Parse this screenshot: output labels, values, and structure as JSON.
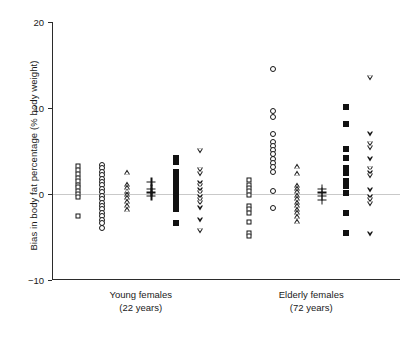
{
  "chart_data": {
    "type": "scatter",
    "title": "",
    "xlabel": "",
    "ylabel": "Bias in body fat percentage (% body weight)",
    "ylim": [
      -10,
      20
    ],
    "yticks": [
      -10,
      0,
      10,
      20
    ],
    "ytick_labels": [
      "−10",
      "0",
      "10",
      "20"
    ],
    "grid": false,
    "legend": null,
    "reference_line": {
      "y": 0,
      "color": "#c9c9c9"
    },
    "groups": [
      {
        "name": "Young females",
        "sublabel": "(22 years)",
        "x_center": 0.255
      },
      {
        "name": "Elderly females",
        "sublabel": "(72 years)",
        "x_center": 0.745
      }
    ],
    "series": [
      {
        "name": "open-square",
        "marker": "open-square",
        "points": [
          {
            "group": 0,
            "x": 0.075,
            "y": 3.2
          },
          {
            "group": 0,
            "x": 0.075,
            "y": 2.8
          },
          {
            "group": 0,
            "x": 0.075,
            "y": 2.3
          },
          {
            "group": 0,
            "x": 0.075,
            "y": 1.9
          },
          {
            "group": 0,
            "x": 0.075,
            "y": 1.5
          },
          {
            "group": 0,
            "x": 0.075,
            "y": 1.1
          },
          {
            "group": 0,
            "x": 0.075,
            "y": 0.8
          },
          {
            "group": 0,
            "x": 0.075,
            "y": 0.4
          },
          {
            "group": 0,
            "x": 0.075,
            "y": 0.0
          },
          {
            "group": 0,
            "x": 0.075,
            "y": -0.4
          },
          {
            "group": 0,
            "x": 0.075,
            "y": -2.6
          },
          {
            "group": 1,
            "x": 0.565,
            "y": 1.6
          },
          {
            "group": 1,
            "x": 0.565,
            "y": 1.1
          },
          {
            "group": 1,
            "x": 0.565,
            "y": 0.7
          },
          {
            "group": 1,
            "x": 0.565,
            "y": 0.3
          },
          {
            "group": 1,
            "x": 0.565,
            "y": -0.1
          },
          {
            "group": 1,
            "x": 0.565,
            "y": -1.4
          },
          {
            "group": 1,
            "x": 0.565,
            "y": -1.8
          },
          {
            "group": 1,
            "x": 0.565,
            "y": -2.2
          },
          {
            "group": 1,
            "x": 0.565,
            "y": -3.2
          },
          {
            "group": 1,
            "x": 0.565,
            "y": -4.5
          },
          {
            "group": 1,
            "x": 0.565,
            "y": -4.9
          }
        ]
      },
      {
        "name": "open-circle",
        "marker": "open-circle",
        "points": [
          {
            "group": 0,
            "x": 0.145,
            "y": 3.4
          },
          {
            "group": 0,
            "x": 0.145,
            "y": 3.0
          },
          {
            "group": 0,
            "x": 0.145,
            "y": 2.6
          },
          {
            "group": 0,
            "x": 0.145,
            "y": 2.2
          },
          {
            "group": 0,
            "x": 0.145,
            "y": 1.8
          },
          {
            "group": 0,
            "x": 0.145,
            "y": 1.4
          },
          {
            "group": 0,
            "x": 0.145,
            "y": 1.0
          },
          {
            "group": 0,
            "x": 0.145,
            "y": 0.6
          },
          {
            "group": 0,
            "x": 0.145,
            "y": 0.2
          },
          {
            "group": 0,
            "x": 0.145,
            "y": -0.2
          },
          {
            "group": 0,
            "x": 0.145,
            "y": -0.6
          },
          {
            "group": 0,
            "x": 0.145,
            "y": -1.0
          },
          {
            "group": 0,
            "x": 0.145,
            "y": -1.4
          },
          {
            "group": 0,
            "x": 0.145,
            "y": -1.8
          },
          {
            "group": 0,
            "x": 0.145,
            "y": -2.2
          },
          {
            "group": 0,
            "x": 0.145,
            "y": -2.6
          },
          {
            "group": 0,
            "x": 0.145,
            "y": -3.0
          },
          {
            "group": 0,
            "x": 0.145,
            "y": -3.4
          },
          {
            "group": 0,
            "x": 0.145,
            "y": -3.9
          },
          {
            "group": 1,
            "x": 0.635,
            "y": 14.5
          },
          {
            "group": 1,
            "x": 0.635,
            "y": 9.6
          },
          {
            "group": 1,
            "x": 0.635,
            "y": 8.9
          },
          {
            "group": 1,
            "x": 0.635,
            "y": 7.0
          },
          {
            "group": 1,
            "x": 0.635,
            "y": 6.1
          },
          {
            "group": 1,
            "x": 0.635,
            "y": 5.6
          },
          {
            "group": 1,
            "x": 0.635,
            "y": 5.1
          },
          {
            "group": 1,
            "x": 0.635,
            "y": 4.6
          },
          {
            "group": 1,
            "x": 0.635,
            "y": 4.1
          },
          {
            "group": 1,
            "x": 0.635,
            "y": 3.6
          },
          {
            "group": 1,
            "x": 0.635,
            "y": 3.1
          },
          {
            "group": 1,
            "x": 0.635,
            "y": 2.6
          },
          {
            "group": 1,
            "x": 0.635,
            "y": 0.4
          },
          {
            "group": 1,
            "x": 0.635,
            "y": -1.6
          }
        ]
      },
      {
        "name": "open-up-triangle",
        "marker": "open-up-triangle",
        "points": [
          {
            "group": 0,
            "x": 0.215,
            "y": 2.6
          },
          {
            "group": 0,
            "x": 0.215,
            "y": 1.2
          },
          {
            "group": 0,
            "x": 0.215,
            "y": 0.8
          },
          {
            "group": 0,
            "x": 0.215,
            "y": 0.4
          },
          {
            "group": 0,
            "x": 0.215,
            "y": 0.0
          },
          {
            "group": 0,
            "x": 0.215,
            "y": -0.4
          },
          {
            "group": 0,
            "x": 0.215,
            "y": -0.8
          },
          {
            "group": 0,
            "x": 0.215,
            "y": -1.3
          },
          {
            "group": 0,
            "x": 0.215,
            "y": -1.8
          },
          {
            "group": 1,
            "x": 0.705,
            "y": 3.3
          },
          {
            "group": 1,
            "x": 0.705,
            "y": 2.4
          },
          {
            "group": 1,
            "x": 0.705,
            "y": 1.0
          },
          {
            "group": 1,
            "x": 0.705,
            "y": 0.7
          },
          {
            "group": 1,
            "x": 0.705,
            "y": 0.3
          },
          {
            "group": 1,
            "x": 0.705,
            "y": -0.1
          },
          {
            "group": 1,
            "x": 0.705,
            "y": -0.5
          },
          {
            "group": 1,
            "x": 0.705,
            "y": -0.9
          },
          {
            "group": 1,
            "x": 0.705,
            "y": -1.3
          },
          {
            "group": 1,
            "x": 0.705,
            "y": -1.7
          },
          {
            "group": 1,
            "x": 0.705,
            "y": -2.1
          },
          {
            "group": 1,
            "x": 0.705,
            "y": -2.6
          },
          {
            "group": 1,
            "x": 0.705,
            "y": -3.1
          }
        ]
      },
      {
        "name": "plus",
        "marker": "plus",
        "points": [
          {
            "group": 0,
            "x": 0.285,
            "y": 1.4
          },
          {
            "group": 0,
            "x": 0.285,
            "y": 0.6
          },
          {
            "group": 0,
            "x": 0.285,
            "y": 0.2
          },
          {
            "group": 0,
            "x": 0.285,
            "y": -0.2
          },
          {
            "group": 1,
            "x": 0.775,
            "y": 0.6
          },
          {
            "group": 1,
            "x": 0.775,
            "y": 0.2
          },
          {
            "group": 1,
            "x": 0.775,
            "y": -0.2
          },
          {
            "group": 1,
            "x": 0.775,
            "y": -0.7
          }
        ]
      },
      {
        "name": "filled-square",
        "marker": "filled-square",
        "points": [
          {
            "group": 0,
            "x": 0.355,
            "y": 4.2
          },
          {
            "group": 0,
            "x": 0.355,
            "y": 3.7
          },
          {
            "group": 0,
            "x": 0.355,
            "y": 2.6
          },
          {
            "group": 0,
            "x": 0.355,
            "y": 2.0
          },
          {
            "group": 0,
            "x": 0.355,
            "y": 1.3
          },
          {
            "group": 0,
            "x": 0.355,
            "y": 0.6
          },
          {
            "group": 0,
            "x": 0.355,
            "y": 0.0
          },
          {
            "group": 0,
            "x": 0.355,
            "y": -0.6
          },
          {
            "group": 0,
            "x": 0.355,
            "y": -1.2
          },
          {
            "group": 0,
            "x": 0.355,
            "y": -1.8
          },
          {
            "group": 0,
            "x": 0.355,
            "y": -3.4
          },
          {
            "group": 1,
            "x": 0.845,
            "y": 10.1
          },
          {
            "group": 1,
            "x": 0.845,
            "y": 8.1
          },
          {
            "group": 1,
            "x": 0.845,
            "y": 5.2
          },
          {
            "group": 1,
            "x": 0.845,
            "y": 4.2
          },
          {
            "group": 1,
            "x": 0.845,
            "y": 3.0
          },
          {
            "group": 1,
            "x": 0.845,
            "y": 2.4
          },
          {
            "group": 1,
            "x": 0.845,
            "y": 1.5
          },
          {
            "group": 1,
            "x": 0.845,
            "y": 0.9
          },
          {
            "group": 1,
            "x": 0.845,
            "y": 0.1
          },
          {
            "group": 1,
            "x": 0.845,
            "y": -2.2
          },
          {
            "group": 1,
            "x": 0.845,
            "y": -4.5
          }
        ]
      },
      {
        "name": "open-down-triangle",
        "marker": "open-down-triangle",
        "points": [
          {
            "group": 0,
            "x": 0.425,
            "y": 5.0
          },
          {
            "group": 0,
            "x": 0.425,
            "y": 2.8
          },
          {
            "group": 0,
            "x": 0.425,
            "y": 2.3
          },
          {
            "group": 0,
            "x": 0.425,
            "y": 1.3
          },
          {
            "group": 0,
            "x": 0.425,
            "y": 0.9
          },
          {
            "group": 0,
            "x": 0.425,
            "y": 0.5
          },
          {
            "group": 0,
            "x": 0.425,
            "y": 0.1
          },
          {
            "group": 0,
            "x": 0.425,
            "y": -0.3
          },
          {
            "group": 0,
            "x": 0.425,
            "y": -0.7
          },
          {
            "group": 0,
            "x": 0.425,
            "y": -1.1
          },
          {
            "group": 0,
            "x": 0.425,
            "y": -1.6
          },
          {
            "group": 0,
            "x": 0.425,
            "y": -3.0
          },
          {
            "group": 0,
            "x": 0.425,
            "y": -4.3
          },
          {
            "group": 1,
            "x": 0.915,
            "y": 13.5
          },
          {
            "group": 1,
            "x": 0.915,
            "y": 7.0
          },
          {
            "group": 1,
            "x": 0.915,
            "y": 5.8
          },
          {
            "group": 1,
            "x": 0.915,
            "y": 5.3
          },
          {
            "group": 1,
            "x": 0.915,
            "y": 4.1
          },
          {
            "group": 1,
            "x": 0.915,
            "y": 2.9
          },
          {
            "group": 1,
            "x": 0.915,
            "y": 2.5
          },
          {
            "group": 1,
            "x": 0.915,
            "y": 2.1
          },
          {
            "group": 1,
            "x": 0.915,
            "y": 0.5
          },
          {
            "group": 1,
            "x": 0.915,
            "y": -0.3
          },
          {
            "group": 1,
            "x": 0.915,
            "y": -0.7
          },
          {
            "group": 1,
            "x": 0.915,
            "y": -1.2
          },
          {
            "group": 1,
            "x": 0.915,
            "y": -4.6
          }
        ]
      }
    ]
  }
}
